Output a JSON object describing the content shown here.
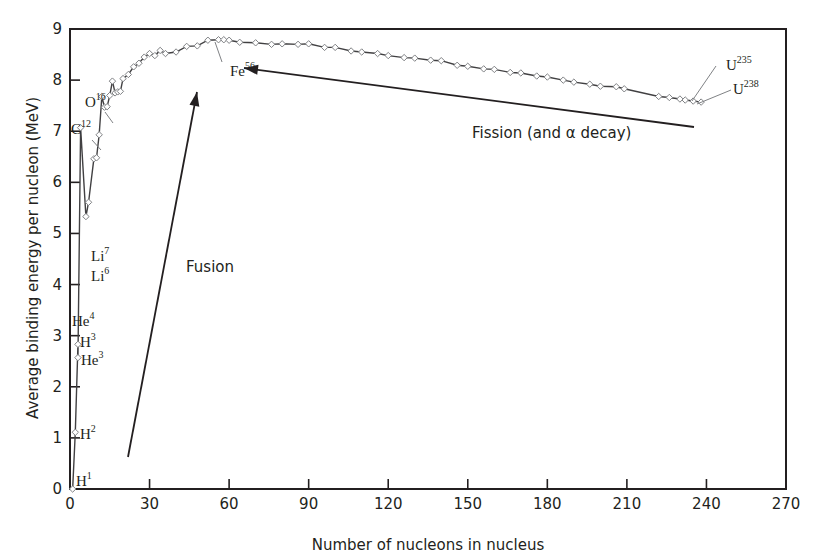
{
  "chart_data": {
    "type": "line",
    "title": "",
    "xlabel": "Number of nucleons in nucleus",
    "ylabel": "Average binding energy per nucleon (MeV)",
    "xlim": [
      0,
      270
    ],
    "ylim": [
      0,
      9
    ],
    "x_ticks": [
      0,
      30,
      60,
      90,
      120,
      150,
      180,
      210,
      240,
      270
    ],
    "y_ticks": [
      0,
      1,
      2,
      3,
      4,
      5,
      6,
      7,
      8,
      9
    ],
    "grid": false,
    "legend": null,
    "series": [
      {
        "name": "Binding energy per nucleon",
        "marker": "open-diamond",
        "x": [
          1,
          2,
          3,
          3,
          4,
          6,
          7,
          9,
          10,
          11,
          12,
          13,
          14,
          15,
          16,
          17,
          18,
          19,
          20,
          22,
          24,
          26,
          28,
          30,
          32,
          34,
          36,
          40,
          44,
          48,
          52,
          56,
          58,
          60,
          64,
          70,
          76,
          80,
          86,
          90,
          96,
          100,
          106,
          110,
          116,
          120,
          126,
          130,
          136,
          140,
          146,
          150,
          156,
          160,
          166,
          170,
          176,
          180,
          186,
          190,
          196,
          200,
          206,
          209,
          222,
          226,
          230,
          232,
          235,
          238
        ],
        "y": [
          0.0,
          1.11,
          2.83,
          2.57,
          7.07,
          5.33,
          5.61,
          6.46,
          6.48,
          6.93,
          7.68,
          7.47,
          7.48,
          7.7,
          7.98,
          7.75,
          7.77,
          7.78,
          8.03,
          8.11,
          8.26,
          8.33,
          8.45,
          8.52,
          8.48,
          8.58,
          8.52,
          8.55,
          8.66,
          8.67,
          8.78,
          8.79,
          8.79,
          8.78,
          8.74,
          8.73,
          8.7,
          8.71,
          8.7,
          8.71,
          8.64,
          8.64,
          8.57,
          8.55,
          8.52,
          8.48,
          8.44,
          8.43,
          8.39,
          8.38,
          8.29,
          8.27,
          8.22,
          8.21,
          8.15,
          8.14,
          8.08,
          8.06,
          8.0,
          7.96,
          7.92,
          7.88,
          7.87,
          7.83,
          7.68,
          7.66,
          7.63,
          7.61,
          7.59,
          7.57
        ]
      }
    ],
    "annotations": [
      {
        "label": "H",
        "sup": "1",
        "x": 1,
        "y": 0.0
      },
      {
        "label": "H",
        "sup": "2",
        "x": 2,
        "y": 1.11
      },
      {
        "label": "H",
        "sup": "3",
        "x": 3,
        "y": 2.83
      },
      {
        "label": "He",
        "sup": "3",
        "x": 3,
        "y": 2.57
      },
      {
        "label": "He",
        "sup": "4",
        "x": 4,
        "y": 7.07
      },
      {
        "label": "Li",
        "sup": "6",
        "x": 6,
        "y": 5.33
      },
      {
        "label": "Li",
        "sup": "7",
        "x": 7,
        "y": 5.61
      },
      {
        "label": "C",
        "sup": "12",
        "x": 12,
        "y": 7.68
      },
      {
        "label": "O",
        "sup": "16",
        "x": 16,
        "y": 7.98
      },
      {
        "label": "Fe",
        "sup": "56",
        "x": 56,
        "y": 8.79
      },
      {
        "label": "U",
        "sup": "235",
        "x": 235,
        "y": 7.59
      },
      {
        "label": "U",
        "sup": "238",
        "x": 238,
        "y": 7.57
      },
      {
        "text": "Fusion",
        "arrow": "from (22,0.6) toward (49,7.7)"
      },
      {
        "text": "Fission (and α decay)",
        "arrow": "from (235,7.05) toward (66,8.2)"
      }
    ]
  },
  "labels": {
    "xlabel": "Number of nucleons in nucleus",
    "ylabel": "Average binding energy per nucleon (MeV)",
    "fusion": "Fusion",
    "fission": "Fission (and α decay)"
  },
  "colors": {
    "axis": "#231f20",
    "curve": "#6d6e71",
    "marker_stroke": "#808285",
    "background": "#ffffff"
  }
}
